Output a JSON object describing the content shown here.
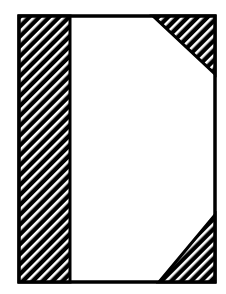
{
  "diagram": {
    "type": "page-layout-shapes",
    "colors": {
      "background": "#ffffff",
      "stroke": "#000000",
      "hatch": "#000000"
    },
    "frame": {
      "x": 18,
      "y": 15,
      "width": 198,
      "height": 268
    },
    "shapes": [
      {
        "name": "left-hatched-strip",
        "kind": "rect",
        "x": 18,
        "y": 15,
        "width": 52,
        "height": 268
      },
      {
        "name": "top-right-hatched-triangle",
        "kind": "triangle",
        "points": [
          [
            153,
            15
          ],
          [
            216,
            15
          ],
          [
            216,
            74
          ]
        ]
      },
      {
        "name": "bottom-right-hatched-triangle",
        "kind": "triangle",
        "points": [
          [
            216,
            215
          ],
          [
            216,
            283
          ],
          [
            159,
            283
          ]
        ]
      }
    ]
  }
}
